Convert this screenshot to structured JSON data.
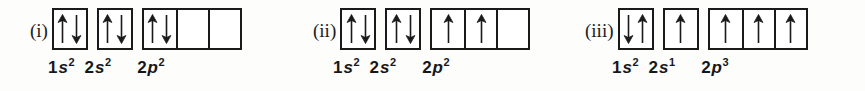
{
  "figure": {
    "type": "orbital-box-diagram",
    "background_color": "#fdfdfc",
    "line_color": "#1a1a1a",
    "text_color": "#17171a"
  },
  "groups": [
    {
      "roman": "(i)",
      "left": 30,
      "label_left": 48,
      "shells": [
        {
          "name": "1s",
          "principal": "1",
          "letter": "s",
          "superscript": "2",
          "boxes": [
            {
              "spins": [
                "up",
                "down"
              ]
            }
          ]
        },
        {
          "name": "2s",
          "principal": "2",
          "letter": "s",
          "superscript": "2",
          "boxes": [
            {
              "spins": [
                "up",
                "down"
              ]
            }
          ]
        },
        {
          "name": "2p",
          "principal": "2",
          "letter": "p",
          "superscript": "2",
          "boxes": [
            {
              "spins": [
                "up",
                "down"
              ]
            },
            {
              "spins": []
            },
            {
              "spins": []
            }
          ]
        }
      ]
    },
    {
      "roman": "(ii)",
      "left": 313,
      "label_left": 333,
      "shells": [
        {
          "name": "1s",
          "principal": "1",
          "letter": "s",
          "superscript": "2",
          "boxes": [
            {
              "spins": [
                "up",
                "down"
              ]
            }
          ]
        },
        {
          "name": "2s",
          "principal": "2",
          "letter": "s",
          "superscript": "2",
          "boxes": [
            {
              "spins": [
                "up",
                "down"
              ]
            }
          ]
        },
        {
          "name": "2p",
          "principal": "2",
          "letter": "p",
          "superscript": "2",
          "boxes": [
            {
              "spins": [
                "up"
              ]
            },
            {
              "spins": [
                "up"
              ]
            },
            {
              "spins": []
            }
          ]
        }
      ]
    },
    {
      "roman": "(iii)",
      "left": 585,
      "label_left": 612,
      "shells": [
        {
          "name": "1s",
          "principal": "1",
          "letter": "s",
          "superscript": "2",
          "boxes": [
            {
              "spins": [
                "down",
                "up"
              ]
            }
          ]
        },
        {
          "name": "2s",
          "principal": "2",
          "letter": "s",
          "superscript": "1",
          "boxes": [
            {
              "spins": [
                "up"
              ]
            }
          ]
        },
        {
          "name": "2p",
          "principal": "2",
          "letter": "p",
          "superscript": "3",
          "boxes": [
            {
              "spins": [
                "up"
              ]
            },
            {
              "spins": [
                "up"
              ]
            },
            {
              "spins": [
                "up"
              ]
            }
          ]
        }
      ]
    }
  ],
  "label_gaps": {
    "gap_1s_2s": 10,
    "gap_2s_2p": 26
  }
}
